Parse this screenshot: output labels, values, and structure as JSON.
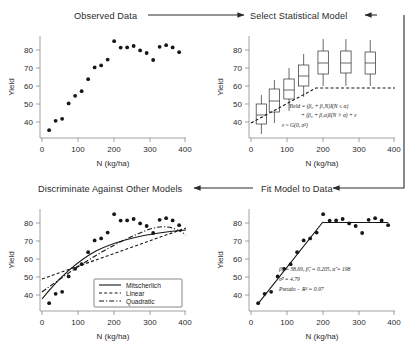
{
  "figure": {
    "axis": {
      "xlabel": "N (kg/ha)",
      "ylabel": "Yield",
      "xticks": [
        "0",
        "100",
        "200",
        "300",
        "400"
      ],
      "yticks": [
        "40",
        "50",
        "60",
        "70",
        "80"
      ],
      "xlim": [
        -22,
        418
      ],
      "ylim": [
        35,
        86
      ]
    }
  },
  "panels": {
    "observed": {
      "title": "Observed Data"
    },
    "select": {
      "title": "Select Statistical Model"
    },
    "discriminate": {
      "title": "Discriminate Against Other Models"
    },
    "fit": {
      "title": "Fit Model to Data"
    }
  },
  "arrows": {
    "top": {
      "name": "observed-to-select",
      "direction": "right"
    },
    "right": {
      "name": "select-to-fit",
      "direction": "down-left"
    },
    "bottom": {
      "name": "fit-to-discriminate",
      "direction": "left"
    }
  },
  "equations": {
    "model_line1": "Yield = (β₀ + β₁N)I(N ≤ α)",
    "model_line2": "+ (β₀ + β₁α)I(N > α) + ε",
    "model_line3": "ε ~ G(0, σ²)"
  },
  "estimates": {
    "line1": "β̂₀ = 38.69, β̂₁ = 0.205, α̂ = 198",
    "line2": "σ̂² = 4.79",
    "line3": "Pseudo − R² = 0.97"
  },
  "legend": {
    "items": [
      {
        "label": "Mitscherlich",
        "style": "solid"
      },
      {
        "label": "Linear",
        "style": "dashed"
      },
      {
        "label": "Quadratic",
        "style": "dash-dot"
      }
    ]
  },
  "chart_data": {
    "type": "scatter",
    "title": "Observed Data",
    "xlabel": "N (kg/ha)",
    "ylabel": "Yield",
    "xlim": [
      -22,
      418
    ],
    "ylim": [
      35,
      86
    ],
    "grid": false,
    "x": [
      0,
      20,
      40,
      60,
      80,
      100,
      120,
      140,
      160,
      180,
      200,
      220,
      240,
      260,
      280,
      300,
      320,
      340,
      360,
      380,
      400
    ],
    "y": [
      38.9,
      43.6,
      44.6,
      52.3,
      56.1,
      58.4,
      64.4,
      70.3,
      71.3,
      74.2,
      83.4,
      80.2,
      80.3,
      81.0,
      78.8,
      77.5,
      74.0,
      80.6,
      81.4,
      80.3,
      77.9
    ],
    "fitted_model": {
      "name": "linear-plateau",
      "beta0": 38.69,
      "beta1": 0.205,
      "alpha": 198,
      "sigma2": 4.79,
      "pseudo_r2": 0.97,
      "plateau": 79.28
    },
    "boxplots": {
      "x": [
        10,
        50,
        95,
        140,
        200,
        270,
        345
      ],
      "median": [
        46.5,
        53.5,
        59.0,
        66.0,
        72.5,
        72.5,
        72.5
      ],
      "q1": [
        42.0,
        48.0,
        54.5,
        61.0,
        67.0,
        67.5,
        67.0
      ],
      "q3": [
        52.0,
        59.5,
        64.5,
        71.5,
        78.5,
        78.5,
        78.0
      ],
      "low": [
        37.0,
        42.5,
        48.5,
        55.5,
        61.0,
        61.0,
        61.0
      ],
      "high": [
        56.5,
        64.0,
        70.0,
        77.0,
        84.5,
        84.5,
        84.0
      ]
    }
  }
}
